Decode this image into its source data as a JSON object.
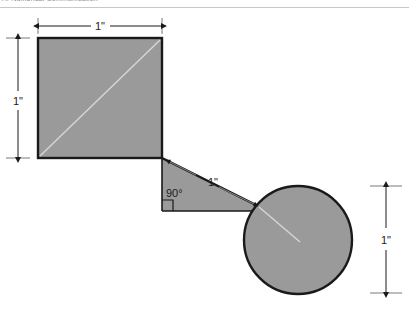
{
  "figure": {
    "header_cut_text": "A. Numerical Communication",
    "background_color": "#ffffff",
    "shape_fill_color": "#9a9a9a",
    "shape_stroke_color": "#1a1a1a",
    "dimension_line_color": "#1a1a1a",
    "inner_line_color": "#d0d0d0",
    "separator_color": "#c8c8c8"
  },
  "dimensions": {
    "top": {
      "label": "1\"",
      "name": "square-width-dimension"
    },
    "left": {
      "label": "1\"",
      "name": "square-height-dimension"
    },
    "diagonal": {
      "label": "1\"",
      "name": "connector-length-dimension"
    },
    "right": {
      "label": "1\"",
      "name": "circle-diameter-dimension"
    }
  },
  "annotations": {
    "right_angle": {
      "label": "90°",
      "name": "right-angle-label"
    }
  },
  "shapes": {
    "square": {
      "name": "square-shape",
      "x": 38,
      "y": 38,
      "size": 124
    },
    "circle": {
      "name": "circle-shape",
      "cx": 298,
      "cy": 240,
      "r": 54
    },
    "triangle": {
      "name": "triangle-shape"
    }
  }
}
